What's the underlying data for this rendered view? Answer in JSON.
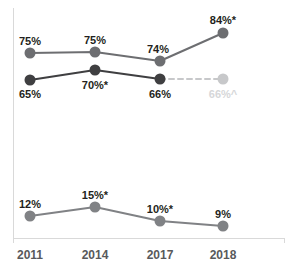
{
  "chart_data": {
    "type": "line",
    "title": "",
    "subtitle": "",
    "xlabel": "",
    "ylabel": "",
    "grid": false,
    "legend": "none",
    "categories": [
      "2011",
      "2014",
      "2017",
      "2018"
    ],
    "x_positions": [
      30,
      95,
      160,
      223
    ],
    "ylim": [
      0,
      100
    ],
    "series": [
      {
        "name": "series-top",
        "color": "#6d6e71",
        "marker_color": "#6d6e71",
        "line_width": 2,
        "label_color": "#231f20",
        "label_position": "above",
        "values": [
          75,
          75,
          74,
          84
        ],
        "point_labels": [
          "75%",
          "75%",
          "74%",
          "84%*"
        ],
        "y_pixels": [
          53,
          52,
          61,
          33
        ],
        "label_y_pixels": [
          45,
          44,
          53,
          24
        ],
        "label_dx": [
          0,
          0,
          -2,
          0
        ]
      },
      {
        "name": "series-middle",
        "color": "#3f3f41",
        "marker_color": "#3f3f41",
        "line_width": 2,
        "label_color": "#231f20",
        "label_position": "below",
        "values": [
          65,
          70,
          66,
          66
        ],
        "point_labels": [
          "65%",
          "70%*",
          "66%",
          "66%^"
        ],
        "y_pixels": [
          80,
          70,
          79,
          79
        ],
        "label_y_pixels": [
          98,
          89,
          98,
          98
        ],
        "label_dx": [
          0,
          0,
          0,
          0
        ],
        "projected_last_point": true,
        "projected_color": "#c7c8ca",
        "projected_label_color": "#d6d7d9",
        "projected_dash": "5,4"
      },
      {
        "name": "series-bottom",
        "color": "#808285",
        "marker_color": "#808285",
        "line_width": 2,
        "label_color": "#231f20",
        "label_position": "above",
        "values": [
          12,
          15,
          10,
          9
        ],
        "point_labels": [
          "12%",
          "15%*",
          "10%*",
          "9%"
        ],
        "y_pixels": [
          216,
          207,
          221,
          226
        ],
        "label_y_pixels": [
          208,
          199,
          213,
          218
        ],
        "label_dx": [
          0,
          0,
          0,
          0
        ]
      }
    ],
    "axis": {
      "left_x": 13,
      "top_y": 8,
      "bottom_y": 238,
      "right_x": 284,
      "tick_length": 5,
      "color": "#d9d9d9"
    },
    "tick_label_y": 259,
    "marker_radius": 5.5
  }
}
